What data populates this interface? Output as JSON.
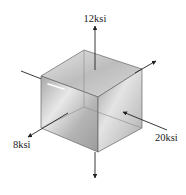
{
  "diagram": {
    "type": "stress-element-cube",
    "labels": {
      "top": "12ksi",
      "left_front": "8ksi",
      "right_front": "20ksi"
    },
    "stresses": [
      {
        "axis": "vertical",
        "value": "12ksi",
        "direction": "tension"
      },
      {
        "axis": "front-left",
        "value": "8ksi",
        "direction": "tension"
      },
      {
        "axis": "front-right",
        "value": "20ksi",
        "direction": "compression"
      }
    ],
    "colors": {
      "cube_light": "#f2f2f2",
      "cube_mid": "#c8c8c8",
      "cube_dark": "#9a9a9a",
      "edge": "#555555",
      "arrow": "#222222",
      "text": "#222222"
    }
  }
}
